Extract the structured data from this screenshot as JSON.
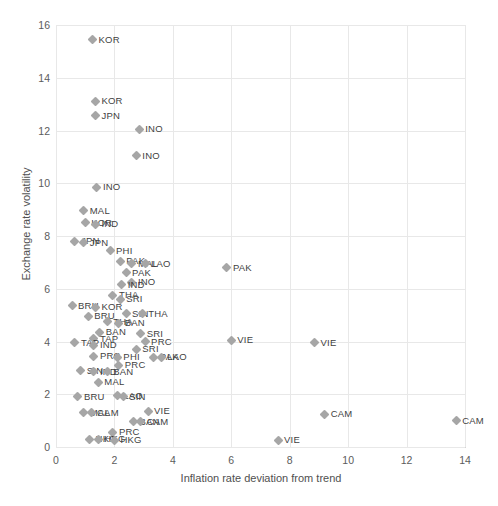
{
  "chart_data": {
    "type": "scatter",
    "title": "",
    "xlabel": "Inflation rate deviation from trend",
    "ylabel": "Exchange rate volatility",
    "xlim": [
      0,
      14
    ],
    "ylim": [
      0,
      16
    ],
    "xticks": [
      0,
      2,
      4,
      6,
      8,
      10,
      12,
      14
    ],
    "yticks": [
      0,
      2,
      4,
      6,
      8,
      10,
      12,
      14,
      16
    ],
    "grid": true,
    "legend": "none",
    "marker": "diamond",
    "marker_color": "#a6a6a6",
    "points": [
      {
        "label": "KOR",
        "x": 1.25,
        "y": 15.45
      },
      {
        "label": "KOR",
        "x": 1.35,
        "y": 13.1
      },
      {
        "label": "JPN",
        "x": 1.35,
        "y": 12.55
      },
      {
        "label": "INO",
        "x": 2.85,
        "y": 12.05
      },
      {
        "label": "INO",
        "x": 2.75,
        "y": 11.05
      },
      {
        "label": "INO",
        "x": 1.4,
        "y": 9.85
      },
      {
        "label": "MAL",
        "x": 0.95,
        "y": 8.95
      },
      {
        "label": "KOR",
        "x": 1.0,
        "y": 8.5
      },
      {
        "label": "IND",
        "x": 1.35,
        "y": 8.45
      },
      {
        "label": "JPN",
        "x": 0.65,
        "y": 7.8
      },
      {
        "label": "JPN",
        "x": 0.95,
        "y": 7.75
      },
      {
        "label": "PHI",
        "x": 1.85,
        "y": 7.45
      },
      {
        "label": "PAK",
        "x": 2.2,
        "y": 7.05
      },
      {
        "label": "MAL",
        "x": 2.6,
        "y": 6.95
      },
      {
        "label": "LAO",
        "x": 3.05,
        "y": 6.95
      },
      {
        "label": "PAK",
        "x": 2.4,
        "y": 6.6
      },
      {
        "label": "PAK",
        "x": 5.85,
        "y": 6.8
      },
      {
        "label": "INO",
        "x": 2.6,
        "y": 6.25
      },
      {
        "label": "IND",
        "x": 2.25,
        "y": 6.15
      },
      {
        "label": "THA",
        "x": 1.95,
        "y": 5.75
      },
      {
        "label": "SRI",
        "x": 2.2,
        "y": 5.6
      },
      {
        "label": "BRU",
        "x": 0.55,
        "y": 5.35
      },
      {
        "label": "KOR",
        "x": 1.35,
        "y": 5.3
      },
      {
        "label": "SIN",
        "x": 2.4,
        "y": 5.05
      },
      {
        "label": "THA",
        "x": 2.95,
        "y": 5.05
      },
      {
        "label": "BRU",
        "x": 1.1,
        "y": 4.95
      },
      {
        "label": "THA",
        "x": 1.75,
        "y": 4.75
      },
      {
        "label": "BAN",
        "x": 2.15,
        "y": 4.7
      },
      {
        "label": "BAN",
        "x": 1.5,
        "y": 4.35
      },
      {
        "label": "SRI",
        "x": 2.9,
        "y": 4.3
      },
      {
        "label": "TAP",
        "x": 1.3,
        "y": 4.1
      },
      {
        "label": "PRC",
        "x": 3.05,
        "y": 4.0
      },
      {
        "label": "TAP",
        "x": 0.65,
        "y": 3.95
      },
      {
        "label": "IND",
        "x": 1.3,
        "y": 3.85
      },
      {
        "label": "VIE",
        "x": 6.0,
        "y": 4.05
      },
      {
        "label": "VIE",
        "x": 8.85,
        "y": 3.95
      },
      {
        "label": "SRI",
        "x": 2.75,
        "y": 3.7
      },
      {
        "label": "PRC",
        "x": 1.3,
        "y": 3.45
      },
      {
        "label": "PHI",
        "x": 2.1,
        "y": 3.4
      },
      {
        "label": "PAK",
        "x": 3.35,
        "y": 3.4
      },
      {
        "label": "LAO",
        "x": 3.6,
        "y": 3.4
      },
      {
        "label": "PRC",
        "x": 2.15,
        "y": 3.1
      },
      {
        "label": "SIN",
        "x": 0.85,
        "y": 2.9
      },
      {
        "label": "IND",
        "x": 1.3,
        "y": 2.85
      },
      {
        "label": "BAN",
        "x": 1.75,
        "y": 2.85
      },
      {
        "label": "MAL",
        "x": 1.45,
        "y": 2.45
      },
      {
        "label": "BRU",
        "x": 0.75,
        "y": 1.9
      },
      {
        "label": "LAO",
        "x": 2.1,
        "y": 1.95
      },
      {
        "label": "SIN",
        "x": 2.3,
        "y": 1.9
      },
      {
        "label": "MAL",
        "x": 0.95,
        "y": 1.3
      },
      {
        "label": "CAM",
        "x": 1.2,
        "y": 1.3
      },
      {
        "label": "VIE",
        "x": 3.15,
        "y": 1.35
      },
      {
        "label": "BAN",
        "x": 2.65,
        "y": 0.95
      },
      {
        "label": "CAM",
        "x": 2.9,
        "y": 0.95
      },
      {
        "label": "CAM",
        "x": 9.2,
        "y": 1.25
      },
      {
        "label": "CAM",
        "x": 13.7,
        "y": 1.0
      },
      {
        "label": "PRC",
        "x": 1.95,
        "y": 0.55
      },
      {
        "label": "HKG",
        "x": 1.15,
        "y": 0.3
      },
      {
        "label": "HKG",
        "x": 1.45,
        "y": 0.3
      },
      {
        "label": "HKG",
        "x": 2.0,
        "y": 0.25
      },
      {
        "label": "VIE",
        "x": 7.6,
        "y": 0.25
      }
    ]
  },
  "caption": ""
}
